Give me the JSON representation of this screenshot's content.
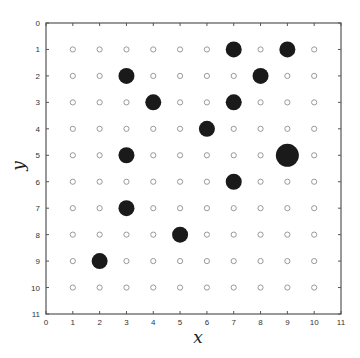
{
  "chart_data": {
    "type": "scatter",
    "title": "",
    "xlabel": "x",
    "ylabel": "y",
    "xlim": [
      0,
      11
    ],
    "ylim": [
      11,
      0
    ],
    "y_axis_inverted": true,
    "grid": false,
    "xticks": [
      0,
      1,
      2,
      3,
      4,
      5,
      6,
      7,
      8,
      9,
      10,
      11
    ],
    "yticks": [
      0,
      1,
      2,
      3,
      4,
      5,
      6,
      7,
      8,
      9,
      10,
      11
    ],
    "background_grid_points": {
      "description": "small open gray circles at every integer lattice point",
      "x_range": [
        1,
        10
      ],
      "y_range": [
        1,
        10
      ],
      "color": "#999999"
    },
    "series": [
      {
        "name": "filled points",
        "color": "#1a1a1a",
        "points": [
          {
            "x": 7,
            "y": 1,
            "size": "medium"
          },
          {
            "x": 9,
            "y": 1,
            "size": "medium"
          },
          {
            "x": 3,
            "y": 2,
            "size": "medium"
          },
          {
            "x": 8,
            "y": 2,
            "size": "medium"
          },
          {
            "x": 4,
            "y": 3,
            "size": "medium"
          },
          {
            "x": 7,
            "y": 3,
            "size": "medium"
          },
          {
            "x": 6,
            "y": 4,
            "size": "medium"
          },
          {
            "x": 3,
            "y": 5,
            "size": "medium"
          },
          {
            "x": 9,
            "y": 5,
            "size": "large"
          },
          {
            "x": 7,
            "y": 6,
            "size": "medium"
          },
          {
            "x": 3,
            "y": 7,
            "size": "medium"
          },
          {
            "x": 5,
            "y": 8,
            "size": "medium"
          },
          {
            "x": 2,
            "y": 9,
            "size": "medium"
          }
        ]
      }
    ]
  },
  "layout": {
    "plot_left": 46,
    "plot_top": 23,
    "plot_right": 341,
    "plot_bottom": 314,
    "radius_small": 2.6,
    "radius_medium": 8,
    "radius_large": 11.5
  }
}
